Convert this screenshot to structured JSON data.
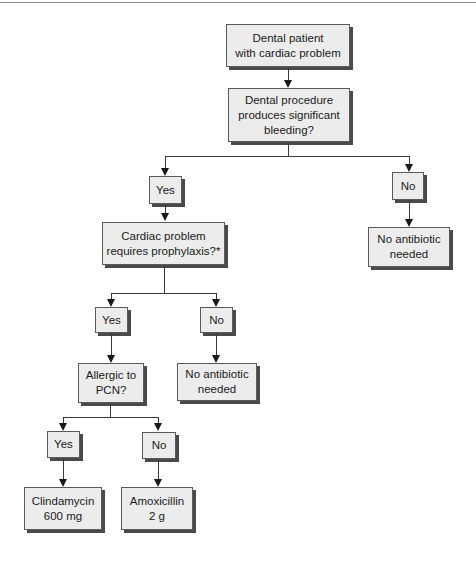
{
  "diagram": {
    "type": "flowchart",
    "nodes": {
      "start": "Dental patient\nwith cardiac problem",
      "q_bleeding": "Dental procedure\nproduces significant\nbleeding?",
      "bleeding_yes": "Yes",
      "bleeding_no": "No",
      "no_antibiotic_1": "No antibiotic\nneeded",
      "q_prophylaxis": "Cardiac problem\nrequires prophylaxis?*",
      "prophylaxis_yes": "Yes",
      "prophylaxis_no": "No",
      "no_antibiotic_2": "No antibiotic\nneeded",
      "q_allergic": "Allergic to\nPCN?",
      "allergic_yes": "Yes",
      "allergic_no": "No",
      "clindamycin": "Clindamycin\n600 mg",
      "amoxicillin": "Amoxicillin\n2 g"
    },
    "edges": [
      [
        "start",
        "q_bleeding"
      ],
      [
        "q_bleeding",
        "bleeding_yes"
      ],
      [
        "q_bleeding",
        "bleeding_no"
      ],
      [
        "bleeding_no",
        "no_antibiotic_1"
      ],
      [
        "bleeding_yes",
        "q_prophylaxis"
      ],
      [
        "q_prophylaxis",
        "prophylaxis_yes"
      ],
      [
        "q_prophylaxis",
        "prophylaxis_no"
      ],
      [
        "prophylaxis_no",
        "no_antibiotic_2"
      ],
      [
        "prophylaxis_yes",
        "q_allergic"
      ],
      [
        "q_allergic",
        "allergic_yes"
      ],
      [
        "q_allergic",
        "allergic_no"
      ],
      [
        "allergic_yes",
        "clindamycin"
      ],
      [
        "allergic_no",
        "amoxicillin"
      ]
    ],
    "colors": {
      "box_fill": "#ececec",
      "box_border": "#5a5a5a",
      "shadow": "#4a4a4a",
      "line": "#3a3a3a"
    }
  }
}
